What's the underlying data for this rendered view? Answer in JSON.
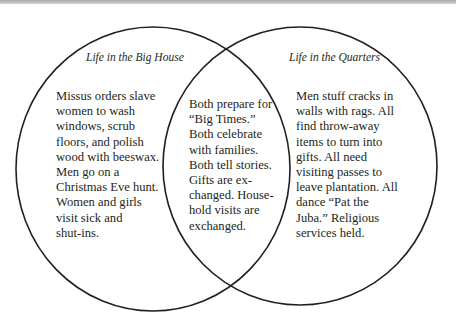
{
  "diagram": {
    "type": "venn",
    "circles": [
      {
        "title": "Life in the Big House",
        "lines": [
          "Missus orders slave",
          "women to wash",
          "windows, scrub",
          "floors, and polish",
          "wood with beeswax.",
          "Men go on a",
          "Christmas Eve hunt.",
          "Women and girls",
          "visit sick and",
          "shut-ins."
        ]
      },
      {
        "title": "Life in the Quarters",
        "lines": [
          "Men stuff cracks in",
          "walls with rags. All",
          "find throw-away",
          "items to turn into",
          "gifts. All need",
          "visiting passes to",
          "leave plantation. All",
          "dance “Pat the",
          "Juba.” Religious",
          "services held."
        ]
      }
    ],
    "overlap": {
      "lines": [
        "Both prepare for",
        "“Big Times.”",
        "Both celebrate",
        "with families.",
        "Both tell stories.",
        "Gifts are ex-",
        "changed. House-",
        "hold visits are",
        "exchanged."
      ]
    },
    "colors": {
      "stroke": "#231f20",
      "text": "#231f20",
      "background": "#ffffff"
    }
  }
}
